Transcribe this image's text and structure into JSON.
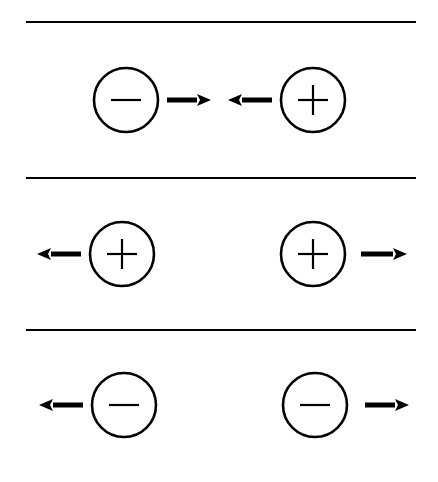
{
  "diagram": {
    "background": "#ffffff",
    "stroke": "#000000",
    "separators_y": [
      22,
      178,
      330
    ],
    "separator_x": [
      26,
      416
    ],
    "rows": [
      {
        "id": "opposite-charges-attract",
        "particles": [
          {
            "charge": "negative",
            "cx": 126,
            "cy": 100,
            "r": 32
          },
          {
            "charge": "positive",
            "cx": 313,
            "cy": 100,
            "r": 32
          }
        ],
        "arrows": [
          {
            "direction": "right",
            "x1": 167,
            "x2": 211,
            "y": 100
          },
          {
            "direction": "left",
            "x1": 272,
            "x2": 228,
            "y": 100
          }
        ]
      },
      {
        "id": "positive-charges-repel",
        "particles": [
          {
            "charge": "positive",
            "cx": 122,
            "cy": 254,
            "r": 32
          },
          {
            "charge": "positive",
            "cx": 313,
            "cy": 254,
            "r": 32
          }
        ],
        "arrows": [
          {
            "direction": "left",
            "x1": 81,
            "x2": 37,
            "y": 254
          },
          {
            "direction": "right",
            "x1": 361,
            "x2": 407,
            "y": 254
          }
        ]
      },
      {
        "id": "negative-charges-repel",
        "particles": [
          {
            "charge": "negative",
            "cx": 124,
            "cy": 405,
            "r": 32
          },
          {
            "charge": "negative",
            "cx": 315,
            "cy": 405,
            "r": 32
          }
        ],
        "arrows": [
          {
            "direction": "left",
            "x1": 83,
            "x2": 39,
            "y": 405
          },
          {
            "direction": "right",
            "x1": 365,
            "x2": 409,
            "y": 405
          }
        ]
      }
    ]
  }
}
